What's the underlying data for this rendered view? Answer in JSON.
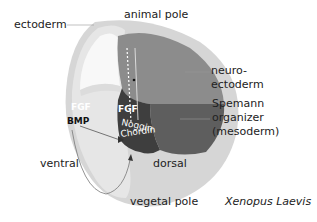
{
  "labels": {
    "ectoderm": "ectoderm",
    "animal_pole": "animal pole",
    "neuroectoderm_line1": "neuro-",
    "neuroectoderm_line2": "ectoderm",
    "spemann_line1": "Spemann",
    "spemann_line2": "organizer",
    "spemann_line3": "(mesoderm)",
    "ventral": "ventral",
    "dorsal": "dorsal",
    "vegetal_pole": "vegetal pole",
    "species": "Xenopus Laevis"
  },
  "signals": {
    "fgf_ventral": "FGF",
    "fgf_dorsal": "FGF",
    "bmp": "BMP",
    "noggin": "Noggin",
    "chordin": "Chordin"
  },
  "colors": {
    "outer_shell": "#d4d4d4",
    "inner_light": "#e8e8e8",
    "blastocoel": "#f7f7f7",
    "neuroectoderm": "#8a8a8a",
    "organizer": "#444444",
    "dorsal_mid": "#6a6a6a"
  }
}
